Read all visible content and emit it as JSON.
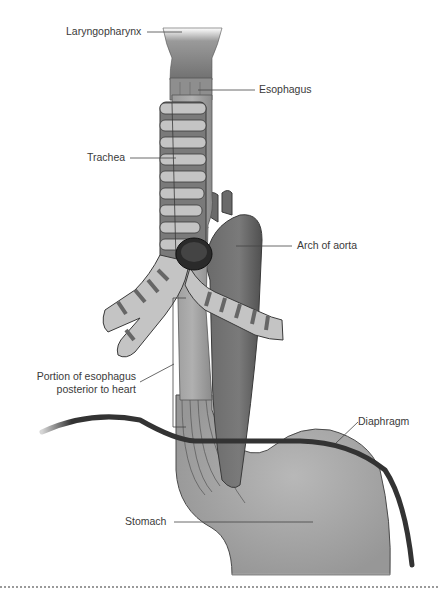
{
  "figure": {
    "type": "anatomical-illustration",
    "colors": {
      "background": "#ffffff",
      "tissue_dark": "#5e5e5e",
      "tissue_mid": "#8a8a8a",
      "tissue_light": "#b4b4b4",
      "ring_light": "#c8c8c8",
      "diaphragm": "#333333",
      "leader_line": "#444444",
      "label_text": "#3a3a3a"
    }
  },
  "labels": {
    "laryngopharynx": "Laryngopharynx",
    "esophagus": "Esophagus",
    "trachea": "Trachea",
    "arch_of_aorta": "Arch of aorta",
    "portion_line1": "Portion of esophagus",
    "portion_line2": "posterior to heart",
    "diaphragm": "Diaphragm",
    "stomach": "Stomach"
  }
}
